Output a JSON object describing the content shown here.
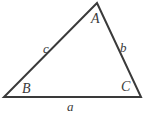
{
  "figure": {
    "kind": "geometry-diagram",
    "shape": "triangle",
    "background_color": "#ffffff",
    "stroke_color": "#3a3a3a",
    "stroke_width_px": 2,
    "label_color": "#3a3a3a",
    "vertices": [
      {
        "id": "A",
        "label": "A",
        "x": 97,
        "y": 3,
        "label_x": 91,
        "label_y": 12
      },
      {
        "id": "B",
        "label": "B",
        "x": 4,
        "y": 97,
        "label_x": 22,
        "label_y": 82
      },
      {
        "id": "C",
        "label": "C",
        "x": 141,
        "y": 97,
        "label_x": 121,
        "label_y": 80
      }
    ],
    "sides": [
      {
        "id": "a",
        "label": "a",
        "from": "B",
        "to": "C",
        "position": "bottom",
        "label_x": 67,
        "label_y": 100
      },
      {
        "id": "b",
        "label": "b",
        "from": "A",
        "to": "C",
        "position": "right",
        "label_x": 120,
        "label_y": 41
      },
      {
        "id": "c",
        "label": "c",
        "from": "A",
        "to": "B",
        "position": "left",
        "label_x": 43,
        "label_y": 42
      }
    ],
    "polygon_points": "97,3 141,97 4,97"
  }
}
